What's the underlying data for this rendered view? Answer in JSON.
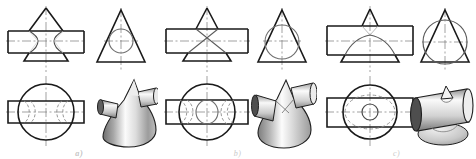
{
  "figure": {
    "background_color": "#ffffff",
    "line_color": "#1a1a1a",
    "thin_line_color": "#555555",
    "hidden_line_color": "#888888",
    "center_line_color": "#7a7a7a",
    "label_color": "#c9c9c9",
    "panel_count": 3,
    "views_per_panel": 4
  },
  "panels": [
    {
      "id": "a",
      "label": "a)",
      "case_name": "small-cylinder-diameter",
      "description": "Cylinder diameter smaller than cone base; curves of intersection are two separate closed curves bulging toward the cone axis",
      "views": {
        "front": {
          "name": "front-view",
          "outline": "triangle-with-horizontal-rectangle",
          "intersection_curve": "two-separate-bulging-curves"
        },
        "side": {
          "name": "side-view",
          "outline": "triangle-with-inscribed-circle",
          "circle_position": "upper-middle",
          "circle_relative_size": "small"
        },
        "top": {
          "name": "top-view",
          "outline": "circle-with-crossing-rectangle",
          "intersection_curve": "two-pairs-of-hidden-arcs"
        },
        "pictorial": {
          "name": "pictorial-view",
          "style": "shaded-3d-solid",
          "description": "tall sharp cone with a slender horizontal cylinder passing through it"
        }
      }
    },
    {
      "id": "b",
      "label": "b)",
      "case_name": "equal-cylinder-diameter",
      "description": "Cylinder diameter equal to the cone diameter at the point of tangency; intersection curves degenerate into two straight lines crossing at a point",
      "views": {
        "front": {
          "name": "front-view",
          "outline": "triangle-with-horizontal-rectangle",
          "intersection_curve": "two-straight-lines-crossing-at-a-point"
        },
        "side": {
          "name": "side-view",
          "outline": "triangle-with-inscribed-circle",
          "circle_position": "centered-tangent",
          "circle_relative_size": "medium"
        },
        "top": {
          "name": "top-view",
          "outline": "circle-with-crossing-rectangle",
          "intersection_curve": "central-ellipse-plus-hidden-arcs"
        },
        "pictorial": {
          "name": "pictorial-view",
          "style": "shaded-3d-solid",
          "description": "cone with a medium horizontal cylinder, lines of intersection meet on the cone surface"
        }
      }
    },
    {
      "id": "c",
      "label": "c)",
      "case_name": "large-cylinder-diameter",
      "description": "Cylinder diameter larger than the cone base; only the tip of the cone projects above the cylinder, intersection is a single closed curve",
      "views": {
        "front": {
          "name": "front-view",
          "outline": "rectangle-with-small-triangular-tip",
          "intersection_curve": "single-continuous-curve"
        },
        "side": {
          "name": "side-view",
          "outline": "triangle-with-large-inscribed-circle",
          "circle_position": "centered-low",
          "circle_relative_size": "large"
        },
        "top": {
          "name": "top-view",
          "outline": "circle-with-crossing-rectangle",
          "intersection_curve": "single-hidden-ellipse-plus-small-circle"
        },
        "pictorial": {
          "name": "pictorial-view",
          "style": "shaded-3d-solid",
          "description": "large horizontal cylinder with only a small cone tip emerging from its top"
        }
      }
    }
  ]
}
